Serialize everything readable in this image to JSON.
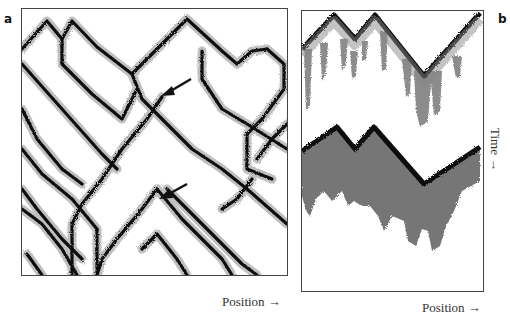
{
  "figure": {
    "panels": [
      {
        "id": "a",
        "label": "a",
        "x_axis_label": "Position →",
        "description": "Space-time diagram of colliding particles (domain walls) forming diamond lattice pattern",
        "annotations": [
          {
            "type": "arrow",
            "label": "arrow-upper"
          },
          {
            "type": "arrow",
            "label": "arrow-lower"
          }
        ]
      },
      {
        "id": "b",
        "label": "b",
        "x_axis_label": "Position →",
        "y_axis_label": "Time →",
        "description": "Two space-time diagrams showing zigzag fronts with downward fuzzy fringes"
      }
    ],
    "colors": {
      "ink": "#111111",
      "fringe": "#7a7a7a",
      "border": "#444444",
      "background": "#ffffff"
    }
  }
}
